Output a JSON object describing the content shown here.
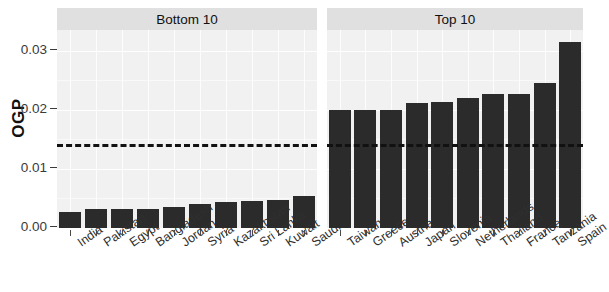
{
  "chart_data": {
    "type": "bar",
    "title": "",
    "xlabel": "",
    "ylabel": "OGP",
    "ylim": [
      0,
      0.0335
    ],
    "y_ticks": [
      0.0,
      0.01,
      0.02,
      0.03
    ],
    "y_tick_labels": [
      "0.00",
      "0.01",
      "0.02",
      "0.03"
    ],
    "grid": true,
    "legend_position": "none",
    "bar_color": "#2b2b2b",
    "panel_strip_color": "#e0e0e0",
    "panel_background_color": "#f1f1f1",
    "reference_line": {
      "value": 0.0142,
      "style": "dashed",
      "color": "#111111"
    },
    "panels": [
      {
        "label": "Bottom 10",
        "categories": [
          "India",
          "Pakistan",
          "Egypt",
          "Bangladesh",
          "Jordan",
          "Syria",
          "Kazakhstan",
          "Sri Lanka",
          "Kuwait",
          "Saudi Arabia"
        ],
        "values": [
          0.0027,
          0.0032,
          0.0032,
          0.0033,
          0.0036,
          0.004,
          0.0044,
          0.0046,
          0.0048,
          0.0055
        ]
      },
      {
        "label": "Top 10",
        "categories": [
          "Taiwan",
          "Greece",
          "Austria",
          "Japan",
          "Slovenia",
          "Netherlands",
          "Thailand",
          "France",
          "Tanzania",
          "Spain"
        ],
        "values": [
          0.02,
          0.02,
          0.02,
          0.0212,
          0.0213,
          0.022,
          0.0226,
          0.0227,
          0.0245,
          0.0315
        ]
      }
    ]
  }
}
